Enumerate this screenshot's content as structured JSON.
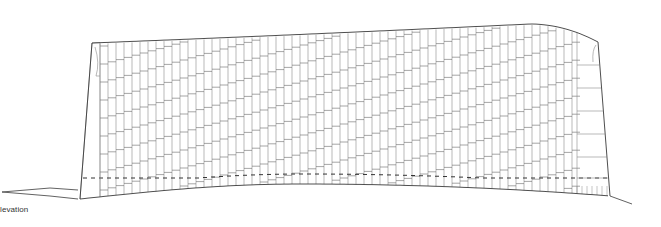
{
  "drawing": {
    "caption": "levation",
    "type": "architectural-elevation",
    "colors": {
      "background": "#ffffff",
      "outline": "#3a3a3a",
      "mullion": "#8a8a8a",
      "transom": "#6a6a6a",
      "dashed": "#333333",
      "caption": "#333333"
    },
    "facade": {
      "left_x": 80,
      "right_x": 610,
      "left_bay_right_x": 100,
      "right_bay_left_x": 577,
      "roof": {
        "left": [
          92,
          43
        ],
        "mid": [
          330,
          33
        ],
        "right_peak": [
          530,
          24
        ],
        "right": [
          598,
          42
        ]
      },
      "base": {
        "left": [
          80,
          199
        ],
        "dip": [
          300,
          184
        ],
        "right": [
          610,
          196
        ]
      },
      "panel_spacing": 8,
      "band_count": 9
    },
    "ground": {
      "left_points": [
        [
          2,
          192
        ],
        [
          50,
          188
        ],
        [
          78,
          190
        ]
      ],
      "right_points": [
        [
          610,
          196
        ],
        [
          632,
          204
        ]
      ]
    }
  }
}
